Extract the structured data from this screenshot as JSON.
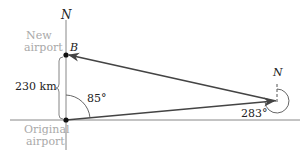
{
  "diagram": {
    "labels": {
      "north_left": "N",
      "north_right": "N",
      "point_b": "B",
      "new_airport_line1": "New",
      "new_airport_line2": "airport",
      "original_airport_line1": "Original",
      "original_airport_line2": "airport",
      "distance": "230 km",
      "angle_origin": "85°",
      "angle_right": "283°"
    },
    "points": {
      "origin": [
        66,
        120
      ],
      "new_airport_B": [
        66,
        55
      ],
      "right_vertex": [
        276,
        101
      ]
    },
    "colors": {
      "lines": "#444444",
      "axes": "#888888",
      "labels_gray": "#a9a9a9",
      "labels_dark": "#222222"
    }
  }
}
